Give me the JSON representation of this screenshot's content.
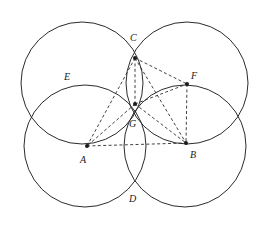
{
  "figure": {
    "type": "geometric-construction",
    "canvas": {
      "width": 261,
      "height": 225,
      "background": "#ffffff"
    },
    "stroke_color": "#2b2b2b",
    "label_color": "#1a1a1a",
    "circles": [
      {
        "name": "circle-top-left",
        "cx": 82,
        "cy": 83,
        "r": 61
      },
      {
        "name": "circle-top-right",
        "cx": 187,
        "cy": 83,
        "r": 61
      },
      {
        "name": "circle-bottom-left",
        "cx": 85,
        "cy": 146,
        "r": 61
      },
      {
        "name": "circle-bottom-right",
        "cx": 185,
        "cy": 146,
        "r": 61
      }
    ],
    "points": [
      {
        "id": "A",
        "label": "A",
        "x": 87,
        "y": 146,
        "label_x": 80,
        "label_y": 163,
        "dot": true
      },
      {
        "id": "B",
        "label": "B",
        "x": 186,
        "y": 143,
        "label_x": 190,
        "label_y": 158,
        "dot": true
      },
      {
        "id": "C",
        "label": "C",
        "x": 135,
        "y": 58,
        "label_x": 130,
        "label_y": 41,
        "dot": true
      },
      {
        "id": "D",
        "label": "D",
        "x": 135,
        "y": 185,
        "label_x": 129,
        "label_y": 202,
        "dot": false
      },
      {
        "id": "E",
        "label": "E",
        "x": 79,
        "y": 84,
        "label_x": 64,
        "label_y": 80,
        "dot": false
      },
      {
        "id": "F",
        "label": "F",
        "x": 187,
        "y": 84,
        "label_x": 191,
        "label_y": 79,
        "dot": true
      },
      {
        "id": "G",
        "label": "G",
        "x": 135,
        "y": 104,
        "label_x": 129,
        "label_y": 127,
        "dot": true
      }
    ],
    "dashed_edges": [
      {
        "name": "edge-C-A",
        "from": "C",
        "to": "A"
      },
      {
        "name": "edge-C-G",
        "from": "C",
        "to": "G"
      },
      {
        "name": "edge-C-B",
        "from": "C",
        "to": "B"
      },
      {
        "name": "edge-C-F",
        "from": "C",
        "to": "F"
      },
      {
        "name": "edge-G-A",
        "from": "G",
        "to": "A"
      },
      {
        "name": "edge-G-B",
        "from": "G",
        "to": "B"
      },
      {
        "name": "edge-G-F",
        "from": "G",
        "to": "F"
      },
      {
        "name": "edge-A-B",
        "from": "A",
        "to": "B"
      },
      {
        "name": "edge-F-B",
        "from": "F",
        "to": "B"
      }
    ],
    "label_font_size": 10
  }
}
